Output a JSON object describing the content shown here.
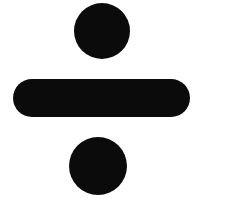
{
  "image": {
    "description": "Division sign (obelus) glyph: a solid dot above and below a thick rounded horizontal bar",
    "symbol": "÷",
    "symbol_name": "division-sign",
    "foreground_color": "#0b0b0b",
    "background_color": "#ffffff"
  }
}
